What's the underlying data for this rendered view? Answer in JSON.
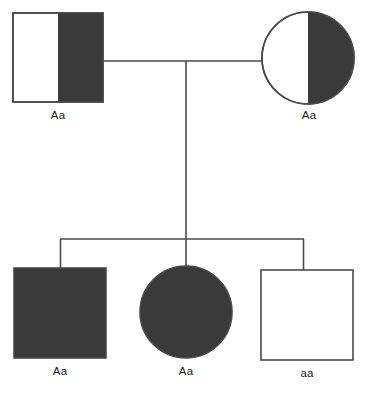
{
  "diagram": {
    "type": "pedigree",
    "canvas": {
      "width": 369,
      "height": 394,
      "background": "#ffffff"
    },
    "colors": {
      "affected_fill": "#3a3a3a",
      "unaffected_fill": "#ffffff",
      "stroke": "#4a4a4a",
      "text": "#1a1a1a"
    },
    "symbol_key": {
      "square": "male",
      "circle": "female",
      "filled": "expresses-dominant-phenotype",
      "half_filled": "heterozygous-half-shaded",
      "open": "unaffected"
    }
  },
  "generations": [
    {
      "id": "generation-1",
      "name": "parents",
      "individuals": [
        {
          "id": "father",
          "shape": "square",
          "sex": "male",
          "fill_style": "half-right-filled",
          "genotype": "Aa",
          "geometry": {
            "x": 13,
            "y": 13,
            "width": 90,
            "height": 89
          }
        },
        {
          "id": "mother",
          "shape": "circle",
          "sex": "female",
          "fill_style": "half-right-filled",
          "genotype": "Aa",
          "geometry": {
            "cx": 308,
            "cy": 58,
            "r": 46
          }
        }
      ]
    },
    {
      "id": "generation-2",
      "name": "offspring",
      "individuals": [
        {
          "id": "child-1",
          "shape": "square",
          "sex": "male",
          "fill_style": "filled",
          "genotype": "Aa",
          "geometry": {
            "x": 14,
            "y": 268,
            "width": 92,
            "height": 90
          }
        },
        {
          "id": "child-2",
          "shape": "circle",
          "sex": "female",
          "fill_style": "filled",
          "genotype": "Aa",
          "geometry": {
            "cx": 186,
            "cy": 312,
            "r": 46
          }
        },
        {
          "id": "child-3",
          "shape": "square",
          "sex": "male",
          "fill_style": "open",
          "genotype": "aa",
          "geometry": {
            "x": 261,
            "y": 270,
            "width": 92,
            "height": 90
          }
        }
      ]
    }
  ],
  "connectors": {
    "mating_line": {
      "x1": 103,
      "y1": 61,
      "x2": 262,
      "y2": 61
    },
    "descent_line": {
      "x": 186,
      "y1": 61,
      "y2": 239
    },
    "sibship_line": {
      "x1": 60,
      "y1": 239,
      "x2": 304,
      "y2": 239
    },
    "drops": [
      {
        "x": 60,
        "y1": 239,
        "y2": 268
      },
      {
        "x": 186,
        "y1": 239,
        "y2": 267
      },
      {
        "x": 304,
        "y1": 239,
        "y2": 270
      }
    ]
  }
}
